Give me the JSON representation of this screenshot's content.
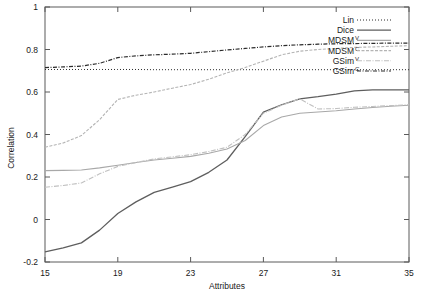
{
  "chart_data": {
    "type": "line",
    "title": "",
    "xlabel": "Attributes",
    "ylabel": "Correlation",
    "xlim": [
      15,
      35
    ],
    "ylim": [
      -0.2,
      1
    ],
    "xticks": [
      15,
      19,
      23,
      27,
      31,
      35
    ],
    "yticks": [
      -0.2,
      0,
      0.2,
      0.4,
      0.6,
      0.8,
      1
    ],
    "xtick_labels": [
      "15",
      "19",
      "23",
      "27",
      "31",
      "35"
    ],
    "ytick_labels": [
      "-0.2",
      "0",
      "0.2",
      "0.4",
      "0.6",
      "0.8",
      "1"
    ],
    "grid": false,
    "legend_position": "top-right-inside",
    "x": [
      15,
      16,
      17,
      18,
      19,
      20,
      21,
      22,
      23,
      24,
      25,
      26,
      27,
      28,
      29,
      30,
      31,
      32,
      33,
      34,
      35
    ],
    "series": [
      {
        "name": "Lin",
        "label": "Lin",
        "superscript": "",
        "style": "dotted",
        "color": "#2b2b2b",
        "width": 1.0,
        "dash": "1,2",
        "values": [
          0.706,
          0.706,
          0.706,
          0.706,
          0.706,
          0.706,
          0.705,
          0.705,
          0.705,
          0.705,
          0.705,
          0.705,
          0.705,
          0.705,
          0.705,
          0.705,
          0.705,
          0.705,
          0.705,
          0.705,
          0.705
        ]
      },
      {
        "name": "Dice",
        "label": "Dice",
        "superscript": "",
        "style": "solid",
        "color": "#5e5e5e",
        "width": 1.3,
        "dash": "",
        "values": [
          -0.152,
          -0.133,
          -0.11,
          -0.05,
          0.028,
          0.083,
          0.128,
          0.152,
          0.178,
          0.222,
          0.28,
          0.39,
          0.505,
          0.54,
          0.568,
          0.578,
          0.59,
          0.605,
          0.61,
          0.61,
          0.61
        ]
      },
      {
        "name": "MDSM",
        "label": "MDSM",
        "superscript": "V",
        "style": "solid",
        "color": "#a8a8a8",
        "width": 1.1,
        "dash": "",
        "values": [
          0.23,
          0.231,
          0.233,
          0.243,
          0.255,
          0.268,
          0.28,
          0.288,
          0.297,
          0.312,
          0.332,
          0.372,
          0.442,
          0.482,
          0.5,
          0.506,
          0.512,
          0.52,
          0.527,
          0.533,
          0.538
        ]
      },
      {
        "name": "MDSM",
        "label": "MDSM",
        "superscript": "C",
        "style": "dashed-light",
        "color": "#b4b4b4",
        "width": 1.1,
        "dash": "3,1.5",
        "values": [
          0.34,
          0.36,
          0.395,
          0.47,
          0.565,
          0.585,
          0.6,
          0.618,
          0.635,
          0.66,
          0.69,
          0.715,
          0.745,
          0.775,
          0.792,
          0.8,
          0.805,
          0.81,
          0.812,
          0.815,
          0.818
        ]
      },
      {
        "name": "GSim",
        "label": "GSim",
        "superscript": "V",
        "style": "dash-dot-light",
        "color": "#c0c0c0",
        "width": 1.1,
        "dash": "5,1.5,1,1.5",
        "values": [
          0.152,
          0.16,
          0.172,
          0.215,
          0.25,
          0.268,
          0.285,
          0.295,
          0.305,
          0.32,
          0.34,
          0.4,
          0.5,
          0.538,
          0.568,
          0.52,
          0.522,
          0.528,
          0.532,
          0.536,
          0.54
        ]
      },
      {
        "name": "GSim",
        "label": "GSim",
        "superscript": "C",
        "style": "dash-dot-dark",
        "color": "#2b2b2b",
        "width": 1.2,
        "dash": "4,1.5,1,1.5",
        "values": [
          0.715,
          0.718,
          0.722,
          0.735,
          0.762,
          0.77,
          0.775,
          0.778,
          0.782,
          0.79,
          0.798,
          0.805,
          0.812,
          0.818,
          0.822,
          0.825,
          0.827,
          0.828,
          0.829,
          0.83,
          0.83
        ]
      }
    ],
    "legend_entries": [
      {
        "label": "Lin",
        "superscript": "",
        "sample": "dotted"
      },
      {
        "label": "Dice",
        "superscript": "",
        "sample": "solid"
      },
      {
        "label": "MDSM",
        "superscript": "V",
        "sample": "solid-light"
      },
      {
        "label": "MDSM",
        "superscript": "C",
        "sample": "dashed-light"
      },
      {
        "label": "GSim",
        "superscript": "V",
        "sample": "dash-dot-light"
      },
      {
        "label": "GSim",
        "superscript": "C",
        "sample": "dash-dot-dark"
      }
    ]
  }
}
